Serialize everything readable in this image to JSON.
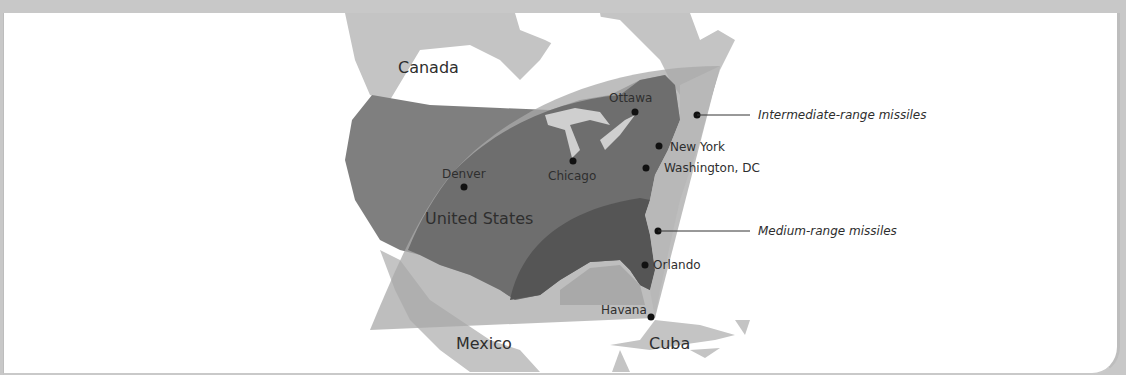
{
  "map": {
    "countries": [
      {
        "name": "Canada",
        "x": 398,
        "y": 58
      },
      {
        "name": "United States",
        "x": 425,
        "y": 209
      },
      {
        "name": "Mexico",
        "x": 456,
        "y": 334
      },
      {
        "name": "Cuba",
        "x": 649,
        "y": 334
      }
    ],
    "cities": [
      {
        "name": "Ottawa",
        "dot_x": 635,
        "dot_y": 112,
        "label_x": 609,
        "label_y": 91
      },
      {
        "name": "New York",
        "dot_x": 659,
        "dot_y": 146,
        "label_x": 670,
        "label_y": 140
      },
      {
        "name": "Washington, DC",
        "dot_x": 646,
        "dot_y": 168,
        "label_x": 664,
        "label_y": 161
      },
      {
        "name": "Chicago",
        "dot_x": 573,
        "dot_y": 161,
        "label_x": 548,
        "label_y": 169
      },
      {
        "name": "Denver",
        "dot_x": 464,
        "dot_y": 187,
        "label_x": 442,
        "label_y": 167
      },
      {
        "name": "Orlando",
        "dot_x": 645,
        "dot_y": 265,
        "label_x": 653,
        "label_y": 258
      },
      {
        "name": "Havana",
        "dot_x": 651,
        "dot_y": 317,
        "label_x": 601,
        "label_y": 303
      }
    ],
    "legend": [
      {
        "label": "Intermediate-range missiles",
        "dot_x": 697,
        "dot_y": 115,
        "line_end_x": 750,
        "label_x": 758,
        "label_y": 108
      },
      {
        "label": "Medium-range missiles",
        "dot_x": 658,
        "dot_y": 231,
        "line_end_x": 750,
        "label_x": 758,
        "label_y": 224
      }
    ],
    "colors": {
      "background": "#ffffff",
      "frame": "#c8c8c8",
      "land": "#c4c4c4",
      "usa": "#7f7f7f",
      "intermediate_range": "#9a9a9a",
      "medium_range": "#5e5e5e",
      "text": "#2e2e2e"
    }
  }
}
